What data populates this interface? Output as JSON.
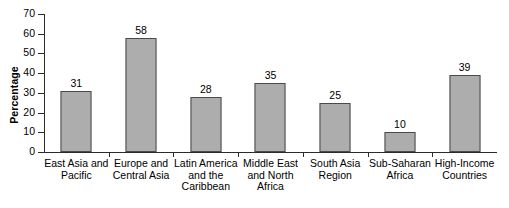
{
  "chart_data": {
    "type": "bar",
    "title": "",
    "xlabel": "",
    "ylabel": "Percentage",
    "ylim": [
      0,
      70
    ],
    "yticks": [
      0,
      10,
      20,
      30,
      40,
      50,
      60,
      70
    ],
    "grid": false,
    "legend": "none",
    "categories": [
      "East Asia and Pacific",
      "Europe and Central Asia",
      "Latin America and the Caribbean",
      "Middle East and North Africa",
      "South Asia Region",
      "Sub-Saharan Africa",
      "High-Income Countries"
    ],
    "values": [
      31,
      58,
      28,
      35,
      25,
      10,
      39
    ],
    "bar_fill_color": "#adadad",
    "bar_border_color": "#4a4a4a",
    "axis_color": "#2b2b2b"
  },
  "axis": {
    "y_title": "Percentage",
    "y_tick_labels": [
      "70",
      "60",
      "50",
      "40",
      "30",
      "20",
      "10",
      "0"
    ]
  },
  "bars": [
    {
      "label": "East Asia and Pacific",
      "value": 31,
      "value_text": "31"
    },
    {
      "label": "Europe and Central Asia",
      "value": 58,
      "value_text": "58"
    },
    {
      "label": "Latin America and the Caribbean",
      "value": 28,
      "value_text": "28"
    },
    {
      "label": "Middle East and North Africa",
      "value": 35,
      "value_text": "35"
    },
    {
      "label": "South Asia Region",
      "value": 25,
      "value_text": "25"
    },
    {
      "label": "Sub-Saharan Africa",
      "value": 10,
      "value_text": "10"
    },
    {
      "label": "High-Income Countries",
      "value": 39,
      "value_text": "39"
    }
  ]
}
